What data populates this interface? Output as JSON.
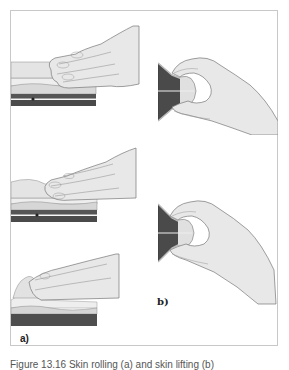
{
  "figure": {
    "panel_a": {
      "label": "a)",
      "description": "Flat hand with fingers pressing and rolling skin over tissue layers, three sequential steps",
      "steps": 3
    },
    "panel_b": {
      "label": "b)",
      "description": "Skin fold lifted between thumb and fingers showing tissue layers, two views",
      "steps": 2
    },
    "caption": "Figure 13.16 Skin rolling (a) and skin lifting (b)"
  },
  "colors": {
    "frame": "#c8c8c8",
    "skin": "#e6e6e6",
    "skin_line": "#8a8a8a",
    "tissue_light": "#d8d8d8",
    "tissue_dark": "#5a5a5a",
    "muscle": "#444444"
  }
}
